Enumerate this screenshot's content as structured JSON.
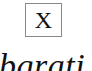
{
  "box": {
    "label": "X"
  },
  "text_fragment": {
    "text": "bgrati"
  },
  "colors": {
    "background": "#ffffff",
    "box_border": "#888888",
    "text": "#111111"
  }
}
